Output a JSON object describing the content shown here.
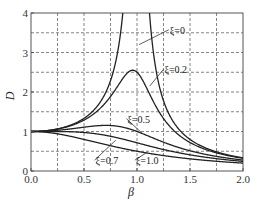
{
  "chart_data": {
    "type": "line",
    "title": "",
    "xlabel": "β",
    "ylabel": "D",
    "xlim": [
      0.0,
      2.0
    ],
    "ylim": [
      0,
      4
    ],
    "grid": true,
    "grid_style": "dashed",
    "x_grid_step": 0.25,
    "y_grid_step": 0.5,
    "x_ticks": [
      0.0,
      0.5,
      1.0,
      1.5,
      2.0
    ],
    "x_tick_labels": [
      "0.0",
      "0.5",
      "1.0",
      "1.5",
      "2.0"
    ],
    "y_ticks": [
      0,
      1,
      2,
      3,
      4
    ],
    "y_tick_labels": [
      "0",
      "1",
      "2",
      "3",
      "4"
    ],
    "formula": "D = 1 / sqrt((1 - β^2)^2 + (2ξβ)^2)",
    "series": [
      {
        "name": "ξ=0",
        "xi": 0.0,
        "label": "ξ=0",
        "x": [
          0.0,
          0.25,
          0.5,
          0.75,
          0.9,
          1.1,
          1.25,
          1.5,
          1.75,
          2.0
        ],
        "values": [
          1.0,
          1.07,
          1.33,
          2.29,
          5.26,
          4.76,
          1.78,
          0.8,
          0.48,
          0.33
        ]
      },
      {
        "name": "ξ=0.2",
        "xi": 0.2,
        "label": "ξ=0.2",
        "x": [
          0.0,
          0.25,
          0.5,
          0.75,
          1.0,
          1.25,
          1.5,
          1.75,
          2.0
        ],
        "values": [
          1.0,
          1.06,
          1.28,
          1.86,
          2.5,
          1.4,
          0.71,
          0.45,
          0.32
        ]
      },
      {
        "name": "ξ=0.5",
        "xi": 0.5,
        "label": "ξ=0.5",
        "x": [
          0.0,
          0.25,
          0.5,
          0.75,
          1.0,
          1.25,
          1.5,
          1.75,
          2.0
        ],
        "values": [
          1.0,
          1.04,
          1.11,
          1.13,
          1.0,
          0.78,
          0.55,
          0.39,
          0.28
        ]
      },
      {
        "name": "ξ=0.7",
        "xi": 0.7,
        "label": "ξ=0.7",
        "x": [
          0.0,
          0.25,
          0.5,
          0.75,
          1.0,
          1.25,
          1.5,
          1.75,
          2.0
        ],
        "values": [
          1.0,
          1.01,
          0.98,
          0.88,
          0.71,
          0.55,
          0.42,
          0.33,
          0.26
        ]
      },
      {
        "name": "ξ=1.0",
        "xi": 1.0,
        "label": "ξ=1.0",
        "x": [
          0.0,
          0.25,
          0.5,
          0.75,
          1.0,
          1.25,
          1.5,
          1.75,
          2.0
        ],
        "values": [
          1.0,
          0.94,
          0.8,
          0.64,
          0.5,
          0.39,
          0.31,
          0.25,
          0.2
        ]
      }
    ],
    "annotations": [
      {
        "text": "ξ=0",
        "label_pos": [
          1.3,
          3.5
        ],
        "arrow_to": [
          1.02,
          3.2
        ]
      },
      {
        "text": "ξ=0.2",
        "label_pos": [
          1.25,
          2.5
        ],
        "arrow_to": [
          1.12,
          2.15
        ]
      },
      {
        "text": "ξ=0.5",
        "label_pos": [
          0.9,
          1.25
        ],
        "arrow_to": [
          1.05,
          0.95
        ]
      },
      {
        "text": "ξ=0.7",
        "label_pos": [
          0.6,
          0.2
        ],
        "arrow_to": [
          0.8,
          0.78
        ]
      },
      {
        "text": "ξ=1.0",
        "label_pos": [
          0.98,
          0.2
        ],
        "arrow_to": [
          1.1,
          0.48
        ]
      }
    ],
    "legend": "none (inline curve labels)"
  }
}
